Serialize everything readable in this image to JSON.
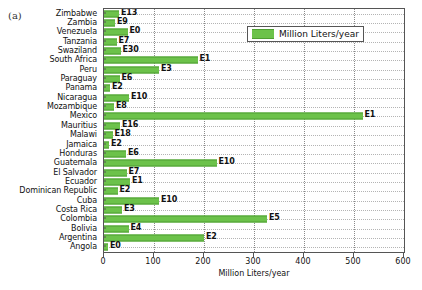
{
  "panel": {
    "letter": "(a)"
  },
  "legend": {
    "label": "Million Liters/year",
    "swatch_color": "#6cc24a",
    "position": "top-right"
  },
  "chart_data": {
    "type": "bar",
    "orientation": "horizontal",
    "title": "",
    "xlabel": "Million Liters/year",
    "ylabel": "",
    "xlim": [
      0,
      600
    ],
    "xticks": [
      0,
      100,
      200,
      300,
      400,
      500,
      600
    ],
    "grid": true,
    "series_name": "Million Liters/year",
    "bar_color": "#6cc24a",
    "categories": [
      "Zimbabwe",
      "Zambia",
      "Venezuela",
      "Tanzania",
      "Swaziland",
      "South Africa",
      "Peru",
      "Paraguay",
      "Panama",
      "Nicaragua",
      "Mozambique",
      "Mexico",
      "Mauritius",
      "Malawi",
      "Jamaica",
      "Honduras",
      "Guatemala",
      "El Salvador",
      "Ecuador",
      "Dominican Republic",
      "Cuba",
      "Costa Rica",
      "Colombia",
      "Bolivia",
      "Argentina",
      "Angola"
    ],
    "values": [
      30,
      22,
      47,
      25,
      33,
      187,
      110,
      31,
      12,
      50,
      20,
      517,
      32,
      17,
      10,
      44,
      225,
      45,
      52,
      27,
      110,
      36,
      326,
      49,
      200,
      8
    ],
    "point_labels": [
      "E13",
      "E9",
      "E0",
      "E7",
      "E30",
      "E1",
      "E3",
      "E6",
      "E2",
      "E10",
      "E8",
      "E1",
      "E16",
      "E18",
      "E2",
      "E6",
      "E10",
      "E7",
      "E1",
      "E2",
      "E10",
      "E3",
      "E5",
      "E4",
      "E2",
      "E0"
    ]
  }
}
